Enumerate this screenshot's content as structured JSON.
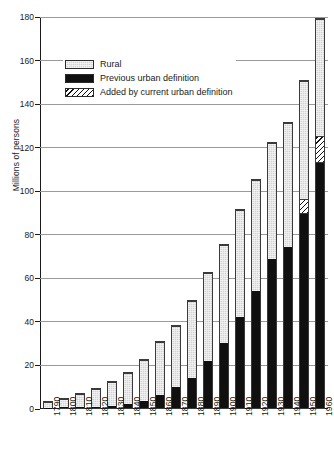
{
  "chart_data": {
    "type": "bar",
    "stacked": true,
    "title": "",
    "xlabel": "",
    "ylabel": "Millions of persons",
    "ylim": [
      0,
      180
    ],
    "ytick_step": 20,
    "yticks": [
      0,
      20,
      40,
      60,
      80,
      100,
      120,
      140,
      160,
      180
    ],
    "grid": true,
    "legend_position": "upper-left-inside",
    "categories": [
      "1790",
      "1800",
      "1810",
      "1820",
      "1830",
      "1840",
      "1850",
      "1860",
      "1870",
      "1880",
      "1890",
      "1900",
      "1910",
      "1920",
      "1930",
      "1940",
      "1950",
      "1960"
    ],
    "series": [
      {
        "name": "Previous urban definition",
        "key": "urban_prev",
        "color": "#101010",
        "values": [
          0.2,
          0.3,
          0.5,
          0.7,
          1.1,
          1.8,
          3.5,
          6.2,
          9.9,
          14.1,
          22.1,
          30.2,
          42.0,
          54.2,
          69.0,
          74.4,
          89.7,
          113.1
        ]
      },
      {
        "name": "Added by current urban definition",
        "key": "urban_added",
        "color": "#ffffff",
        "hatch": "diagonal",
        "values": [
          0,
          0,
          0,
          0,
          0,
          0,
          0,
          0,
          0,
          0,
          0,
          0,
          0,
          0,
          0,
          0,
          6.8,
          12.3
        ]
      },
      {
        "name": "Rural",
        "key": "rural",
        "color": "#d2d2d2",
        "values": [
          3.7,
          4.9,
          6.7,
          8.9,
          11.7,
          15.2,
          19.6,
          25.2,
          28.7,
          36.0,
          40.8,
          45.8,
          49.9,
          51.6,
          53.8,
          57.2,
          54.8,
          54.1
        ]
      }
    ],
    "totals": [
      3.9,
      5.2,
      7.2,
      9.6,
      12.8,
      17.0,
      23.1,
      31.4,
      38.6,
      50.1,
      62.9,
      76.0,
      91.9,
      105.8,
      122.8,
      131.6,
      151.3,
      179.5
    ],
    "legend": [
      {
        "label": "Rural",
        "key": "rural"
      },
      {
        "label": "Previous urban definition",
        "key": "urban_prev"
      },
      {
        "label": "Added by current urban definition",
        "key": "urban_added"
      }
    ]
  }
}
